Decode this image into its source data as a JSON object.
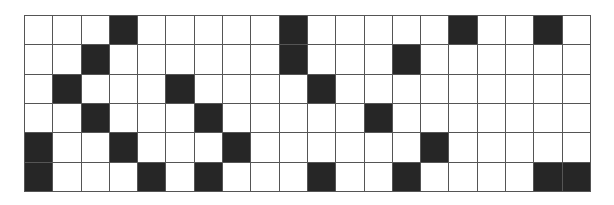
{
  "grid": {
    "rows": 6,
    "cols": 20,
    "filled_color": "#262626",
    "empty_color": "#ffffff",
    "line_color": "#555555",
    "cells": [
      [
        0,
        0,
        0,
        1,
        0,
        0,
        0,
        0,
        0,
        1,
        0,
        0,
        0,
        0,
        0,
        1,
        0,
        0,
        1,
        0
      ],
      [
        0,
        0,
        1,
        0,
        0,
        0,
        0,
        0,
        0,
        1,
        0,
        0,
        0,
        1,
        0,
        0,
        0,
        0,
        0,
        0
      ],
      [
        0,
        1,
        0,
        0,
        0,
        1,
        0,
        0,
        0,
        0,
        1,
        0,
        0,
        0,
        0,
        0,
        0,
        0,
        0,
        0
      ],
      [
        0,
        0,
        1,
        0,
        0,
        0,
        1,
        0,
        0,
        0,
        0,
        0,
        1,
        0,
        0,
        0,
        0,
        0,
        0,
        0
      ],
      [
        1,
        0,
        0,
        1,
        0,
        0,
        0,
        1,
        0,
        0,
        0,
        0,
        0,
        0,
        1,
        0,
        0,
        0,
        0,
        0
      ],
      [
        1,
        0,
        0,
        0,
        1,
        0,
        1,
        0,
        0,
        0,
        1,
        0,
        0,
        1,
        0,
        0,
        0,
        0,
        1,
        1
      ]
    ]
  }
}
